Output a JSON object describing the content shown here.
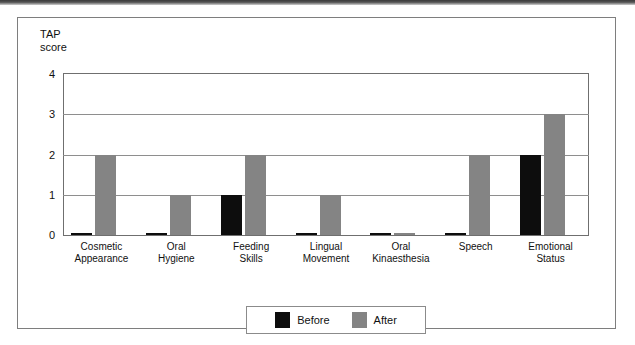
{
  "figure": {
    "axis_title": "TAP\nscore"
  },
  "legend": {
    "items": [
      {
        "label": "Before",
        "color": "#0d0d0d"
      },
      {
        "label": "After",
        "color": "#848484"
      }
    ]
  },
  "chart_data": {
    "type": "bar",
    "title": "",
    "xlabel": "",
    "ylabel": "TAP score",
    "ylim": [
      0,
      4
    ],
    "yticks": [
      "0",
      "1",
      "2",
      "3",
      "4"
    ],
    "grid": true,
    "legend_position": "bottom",
    "categories": [
      "Cosmetic\nAppearance",
      "Oral\nHygiene",
      "Feeding\nSkills",
      "Lingual\nMovement",
      "Oral\nKinaesthesia",
      "Speech",
      "Emotional\nStatus"
    ],
    "series": [
      {
        "name": "Before",
        "color": "#0d0d0d",
        "values": [
          0,
          0,
          1,
          0,
          0,
          0,
          2
        ]
      },
      {
        "name": "After",
        "color": "#848484",
        "values": [
          2,
          1,
          2,
          1,
          0,
          2,
          3
        ]
      }
    ]
  }
}
